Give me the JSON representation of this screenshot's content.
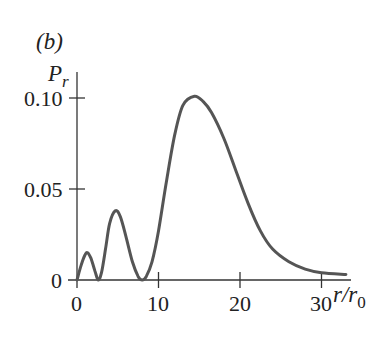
{
  "chart_data": {
    "type": "line",
    "panel_label": "(b)",
    "title": "",
    "xlabel": "r/r0",
    "ylabel": "P_r",
    "xlim": [
      0,
      33
    ],
    "ylim": [
      0,
      0.11
    ],
    "x_ticks": [
      0,
      10,
      20,
      30
    ],
    "x_tick_labels": [
      "0",
      "10",
      "20",
      "30"
    ],
    "y_ticks": [
      0,
      0.05,
      0.1
    ],
    "y_tick_labels": [
      "0",
      "0.05",
      "0.10"
    ],
    "grid": false,
    "legend": null,
    "series": [
      {
        "name": "P_r",
        "color": "#555555",
        "x": [
          0,
          0.5,
          1.0,
          1.3,
          1.7,
          2.2,
          2.6,
          3.0,
          3.5,
          4.0,
          4.7,
          5.3,
          6.0,
          6.8,
          7.5,
          8.0,
          8.5,
          9.2,
          10.0,
          11.0,
          12.0,
          13.0,
          14.4,
          15.5,
          16.5,
          18.0,
          19.5,
          21.0,
          22.5,
          24.0,
          26.0,
          28.0,
          30.0,
          33.0
        ],
        "y": [
          0,
          0.008,
          0.014,
          0.015,
          0.012,
          0.005,
          0.0,
          0.004,
          0.017,
          0.031,
          0.038,
          0.035,
          0.024,
          0.01,
          0.002,
          0.0,
          0.002,
          0.01,
          0.027,
          0.055,
          0.08,
          0.096,
          0.101,
          0.098,
          0.092,
          0.078,
          0.06,
          0.042,
          0.027,
          0.017,
          0.01,
          0.006,
          0.004,
          0.003
        ]
      }
    ]
  },
  "labels": {
    "panel": "(b)",
    "y_axis_main": "P",
    "y_axis_sub": "r",
    "x_axis_main": "r/r",
    "x_axis_sub": "0",
    "ytick_0": "0",
    "ytick_1": "0.05",
    "ytick_2": "0.10",
    "xtick_0": "0",
    "xtick_1": "10",
    "xtick_2": "20",
    "xtick_3": "30"
  }
}
